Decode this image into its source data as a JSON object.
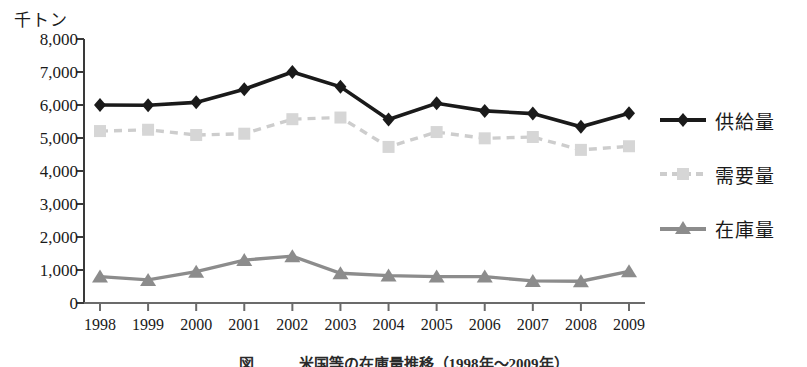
{
  "figure": {
    "unit_label": "千トン",
    "caption": "図　　　米国等の在庫量推移（1998年～2009年）"
  },
  "legend": {
    "position": "right",
    "items": [
      {
        "label": "供給量",
        "marker": "diamond",
        "color": "#1a1a1a",
        "style": "solid"
      },
      {
        "label": "需要量",
        "marker": "square",
        "color": "#cdcdcd",
        "style": "dashed"
      },
      {
        "label": "在庫量",
        "marker": "triangle",
        "color": "#8c8c8c",
        "style": "solid"
      }
    ]
  },
  "chart_data": {
    "type": "line",
    "title": "",
    "xlabel": "",
    "ylabel": "千トン",
    "ylim": [
      0,
      8000
    ],
    "yticks": [
      0,
      1000,
      2000,
      3000,
      4000,
      5000,
      6000,
      7000,
      8000
    ],
    "ytick_labels": [
      "0",
      "1,000",
      "2,000",
      "3,000",
      "4,000",
      "5,000",
      "6,000",
      "7,000",
      "8,000"
    ],
    "grid": false,
    "categories": [
      "1998",
      "1999",
      "2000",
      "2001",
      "2002",
      "2003",
      "2004",
      "2005",
      "2006",
      "2007",
      "2008",
      "2009"
    ],
    "series": [
      {
        "name": "供給量",
        "color": "#1a1a1a",
        "marker": "diamond",
        "style": "solid",
        "values": [
          6000,
          5990,
          6080,
          6480,
          7000,
          6550,
          5560,
          6050,
          5820,
          5740,
          5340,
          5750
        ]
      },
      {
        "name": "需要量",
        "color": "#cdcdcd",
        "marker": "square",
        "style": "dashed",
        "values": [
          5210,
          5250,
          5090,
          5130,
          5570,
          5620,
          4730,
          5180,
          4990,
          5030,
          4640,
          4750
        ]
      },
      {
        "name": "在庫量",
        "color": "#8c8c8c",
        "marker": "triangle",
        "style": "solid",
        "values": [
          800,
          700,
          950,
          1300,
          1420,
          900,
          830,
          800,
          800,
          670,
          660,
          960
        ]
      }
    ]
  }
}
